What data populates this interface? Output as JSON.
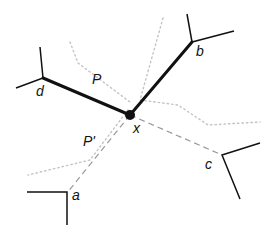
{
  "diagram": {
    "type": "graph-paths",
    "colors": {
      "solid": "#111111",
      "dashed": "#9a9a9a",
      "dotted": "#c4c4c4",
      "background": "#ffffff"
    },
    "nodes": [
      {
        "id": "x",
        "label": "x",
        "x": 130,
        "y": 115,
        "label_x": 124,
        "label_y": 121,
        "filled": true
      },
      {
        "id": "d",
        "label": "d",
        "x": 43,
        "y": 78,
        "label_x": 36,
        "label_y": 84
      },
      {
        "id": "b",
        "label": "b",
        "x": 192,
        "y": 42,
        "label_x": 196,
        "label_y": 44
      },
      {
        "id": "a",
        "label": "a",
        "x": 67,
        "y": 193,
        "label_x": 72,
        "label_y": 189
      },
      {
        "id": "c",
        "label": "c",
        "x": 222,
        "y": 155,
        "label_x": 205,
        "label_y": 156
      }
    ],
    "edges": [
      {
        "from": "d",
        "to": "x",
        "style": "solid-thick"
      },
      {
        "from": "x",
        "to": "b",
        "style": "solid-thick"
      },
      {
        "from": "x",
        "to": "a",
        "style": "dashed"
      },
      {
        "from": "x",
        "to": "c",
        "style": "dashed"
      }
    ],
    "path_labels": [
      {
        "id": "P",
        "text": "P",
        "x": 92,
        "y": 73
      },
      {
        "id": "P_prime",
        "text": "P'",
        "x": 83,
        "y": 135
      }
    ]
  }
}
